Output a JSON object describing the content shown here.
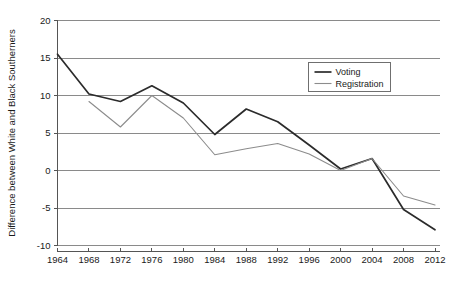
{
  "chart_data": {
    "type": "line",
    "title": "",
    "subtitle": "",
    "xlabel": "",
    "ylabel": "Difference between White and Black Southerners",
    "x": [
      1964,
      1968,
      1972,
      1976,
      1980,
      1984,
      1988,
      1992,
      1996,
      2000,
      2004,
      2008,
      2012
    ],
    "categories": [
      "1964",
      "1968",
      "1972",
      "1976",
      "1980",
      "1984",
      "1988",
      "1992",
      "1996",
      "2000",
      "2004",
      "2008",
      "2012"
    ],
    "xlim": [
      1964,
      2012
    ],
    "ylim": [
      -10,
      20
    ],
    "yticks": [
      20,
      15,
      10,
      5,
      0,
      -5,
      -10
    ],
    "ytick_labels": [
      "20",
      "15",
      "10",
      "5",
      "0",
      "-5",
      "-10"
    ],
    "xticks": [
      1964,
      1968,
      1972,
      1976,
      1980,
      1984,
      1988,
      1992,
      1996,
      2000,
      2004,
      2008,
      2012
    ],
    "xtick_labels": [
      "1964",
      "1968",
      "1972",
      "1976",
      "1980",
      "1984",
      "1988",
      "1992",
      "1996",
      "2000",
      "2004",
      "2008",
      "2012"
    ],
    "grid": "horizontal",
    "legend_position": "upper-right",
    "series": [
      {
        "name": "Voting",
        "color": "#2b2b2b",
        "x": [
          1964,
          1968,
          1972,
          1976,
          1980,
          1984,
          1988,
          1992,
          1996,
          2000,
          2004,
          2008,
          2012
        ],
        "values": [
          15.5,
          10.2,
          9.2,
          11.3,
          9.0,
          4.8,
          8.2,
          6.5,
          3.4,
          0.2,
          1.6,
          -5.2,
          -7.9
        ]
      },
      {
        "name": "Registration",
        "color": "#8c8c8c",
        "x": [
          1968,
          1972,
          1976,
          1980,
          1984,
          1988,
          1992,
          1996,
          2000,
          2004,
          2008,
          2012
        ],
        "values": [
          9.2,
          5.8,
          10.0,
          7.0,
          2.1,
          2.9,
          3.6,
          2.2,
          0.0,
          1.6,
          -3.4,
          -4.6
        ]
      }
    ]
  },
  "legend": {
    "items": [
      {
        "label": "Voting",
        "color": "#2b2b2b"
      },
      {
        "label": "Registration",
        "color": "#8c8c8c"
      }
    ]
  },
  "axes": {
    "y_axis_label": "Difference between White and Black Southerners"
  }
}
